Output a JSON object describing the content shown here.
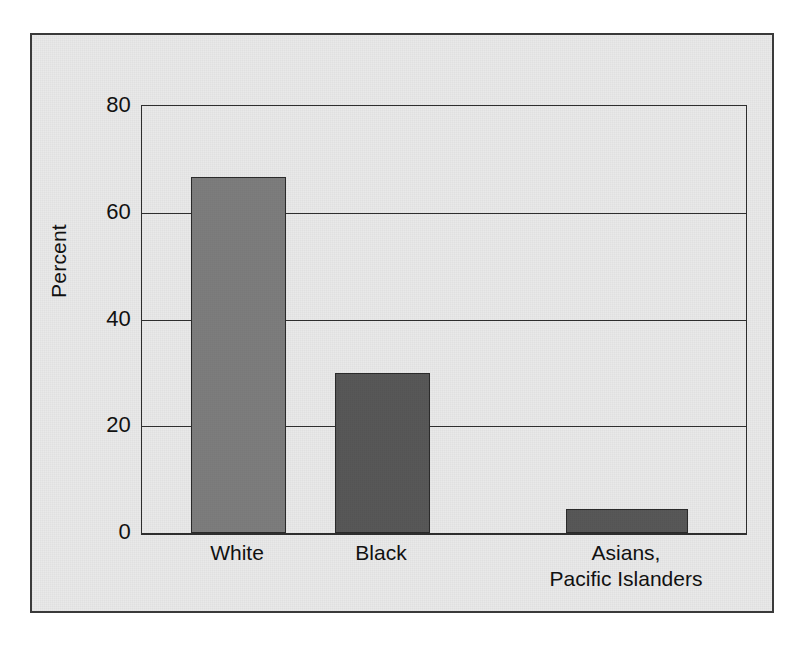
{
  "chart_data": {
    "type": "bar",
    "title": "",
    "subtitle": "",
    "xlabel": "",
    "ylabel": "Percent",
    "ylim": [
      0,
      80
    ],
    "yticks": [
      0,
      20,
      40,
      60,
      80
    ],
    "ytick_labels": [
      "0",
      "20",
      "40",
      "60",
      "80"
    ],
    "grid": true,
    "legend": false,
    "legend_position": "none",
    "categories": [
      "White",
      "Black",
      "Asians, Pacific Islanders"
    ],
    "category_label_lines": [
      [
        "White"
      ],
      [
        "Black"
      ],
      [
        "Asians,",
        "Pacific Islanders"
      ]
    ],
    "values": [
      66.7,
      30.0,
      4.5
    ],
    "bars": [
      {
        "category": "White",
        "value": 66.7,
        "color": "#7d7d7d",
        "style": "bar-light"
      },
      {
        "category": "Black",
        "value": 30.0,
        "color": "#585858",
        "style": "bar-dark"
      },
      {
        "category": "Asians, Pacific Islanders",
        "value": 4.5,
        "color": "#585858",
        "style": "bar-dark"
      }
    ],
    "colors": {
      "bar_light": "#7d7d7d",
      "bar_dark": "#585858",
      "axis": "#2f2f2f",
      "panel_background": "#e9e9e9",
      "frame_border": "#3a3a3a",
      "text": "#111111"
    }
  }
}
